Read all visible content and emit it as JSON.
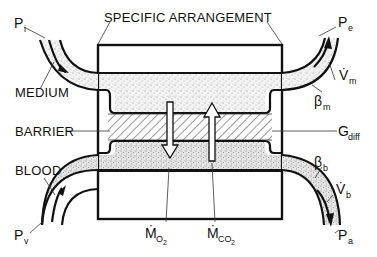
{
  "title": "SPECIFIC ARRANGEMENT",
  "labels": {
    "medium": "MEDIUM",
    "barrier": "BARRIER",
    "blood": "BLOOD",
    "specific_arrangement": "SPECIFIC ARRANGEMENT"
  },
  "symbols": {
    "p_i": {
      "base": "P",
      "sub": "i"
    },
    "p_e": {
      "base": "P",
      "sub": "e"
    },
    "p_v": {
      "base": "P",
      "sub": "v"
    },
    "p_a": {
      "base": "P",
      "sub": "a"
    },
    "v_m": {
      "base": "V̇",
      "sub": "m"
    },
    "v_b": {
      "base": "V̇",
      "sub": "b"
    },
    "beta_m": {
      "base": "β",
      "sub": "m"
    },
    "beta_b": {
      "base": "β",
      "sub": "b"
    },
    "g_diff": {
      "base": "G",
      "sub": "diff"
    },
    "m_o2": {
      "base": "Ṁ",
      "sub": "O",
      "subsub": "2"
    },
    "m_co2": {
      "base": "Ṁ",
      "sub": "CO",
      "subsub": "2"
    }
  },
  "colors": {
    "ink": "#111111",
    "background": "#ffffff",
    "stipple": "#9a9a9a"
  }
}
